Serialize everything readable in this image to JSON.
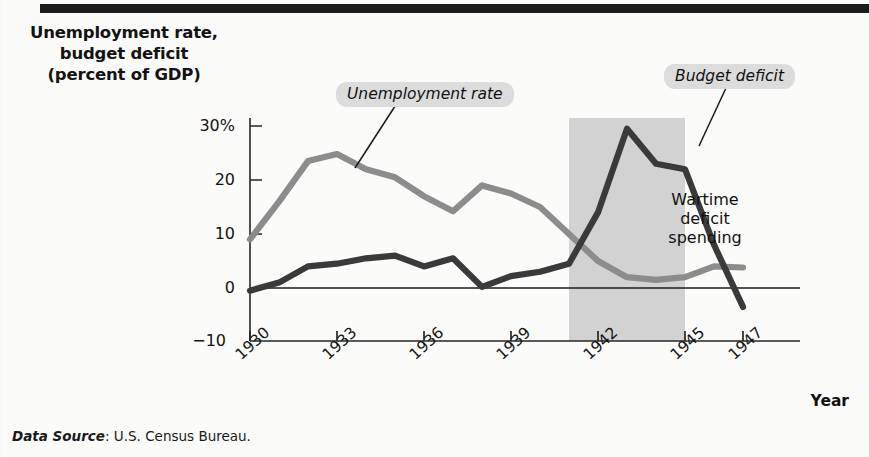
{
  "figure": {
    "title_lines": [
      "Unemployment rate,",
      "budget deficit",
      "(percent of GDP)"
    ],
    "x_axis_name": "Year",
    "source_label": "Data Source",
    "source_text": ": U.S. Census Bureau."
  },
  "callouts": {
    "unemployment": "Unemployment rate",
    "budget_deficit": "Budget deficit",
    "wartime_lines": [
      "Wartime",
      "deficit",
      "spending"
    ]
  },
  "colors": {
    "unemployment_line": "#8c8c8c",
    "deficit_line": "#3a3a3a",
    "war_band": "#d2d2d2",
    "axis": "#262626",
    "pill_bg": "#dcdcdc",
    "background": "#fbfbf9"
  },
  "chart_data": {
    "type": "line",
    "title": "Unemployment rate, budget deficit (percent of GDP)",
    "xlabel": "Year",
    "ylabel": "Unemployment rate, budget deficit (percent of GDP)",
    "xlim": [
      1930,
      1947
    ],
    "ylim": [
      -10,
      32
    ],
    "ytick_labels": [
      "30%",
      "20",
      "10",
      "0",
      "−10"
    ],
    "ytick_values": [
      30,
      20,
      10,
      0,
      -10
    ],
    "xtick_labels": [
      "1930",
      "1933",
      "1936",
      "1939",
      "1942",
      "1945",
      "1947"
    ],
    "xtick_values": [
      1930,
      1933,
      1936,
      1939,
      1942,
      1945,
      1947
    ],
    "grid": false,
    "legend": "annotated callouts",
    "zero_line": 0,
    "shaded_region": {
      "label": "Wartime deficit spending",
      "x_start": 1941,
      "x_end": 1945
    },
    "x": [
      1930,
      1931,
      1932,
      1933,
      1934,
      1935,
      1936,
      1937,
      1938,
      1939,
      1940,
      1941,
      1942,
      1943,
      1944,
      1945,
      1946,
      1947
    ],
    "series": [
      {
        "name": "Unemployment rate",
        "values": [
          9,
          16,
          23.5,
          24.8,
          22,
          20.5,
          17,
          14.2,
          19,
          17.5,
          15,
          10,
          5,
          2,
          1.5,
          2,
          4,
          3.8
        ]
      },
      {
        "name": "Budget deficit",
        "values": [
          -0.5,
          1,
          4,
          4.5,
          5.5,
          6,
          4,
          5.5,
          0.2,
          2.2,
          3,
          4.5,
          14,
          29.5,
          23,
          22,
          8,
          -3.5
        ]
      }
    ],
    "annotations": [
      {
        "text": "Unemployment rate",
        "target_x": 1936,
        "target_y": 20.5
      },
      {
        "text": "Budget deficit",
        "target_x": 1943,
        "target_y": 26
      },
      {
        "text": "Wartime deficit spending",
        "target_x": 1943,
        "target_y": 9
      }
    ]
  }
}
